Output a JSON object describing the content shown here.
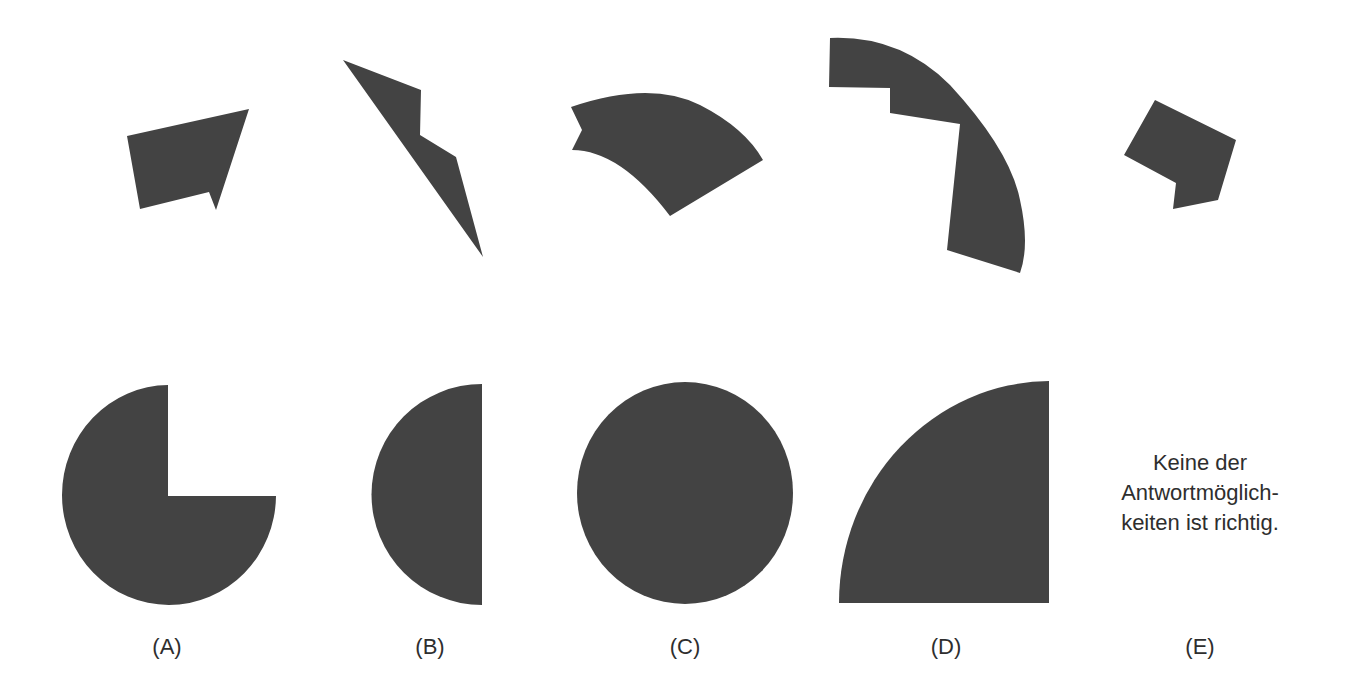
{
  "puzzle": {
    "fill_color": "#434343",
    "pieces": [
      {
        "id": "piece-1",
        "shape": "arrow-quadrilateral"
      },
      {
        "id": "piece-2",
        "shape": "slanted-zigzag-sliver"
      },
      {
        "id": "piece-3",
        "shape": "circular-sector-with-cut"
      },
      {
        "id": "piece-4",
        "shape": "stepped-arc-band"
      },
      {
        "id": "piece-5",
        "shape": "notched-square"
      }
    ],
    "options": [
      {
        "label": "(A)",
        "shape": "three-quarter-circle"
      },
      {
        "label": "(B)",
        "shape": "half-circle-left"
      },
      {
        "label": "(C)",
        "shape": "circle"
      },
      {
        "label": "(D)",
        "shape": "quarter-circle"
      },
      {
        "label": "(E)",
        "shape": "text-answer"
      }
    ],
    "option_e_text": {
      "line1": "Keine der",
      "line2": "Antwortmöglich-",
      "line3": "keiten ist richtig."
    }
  }
}
